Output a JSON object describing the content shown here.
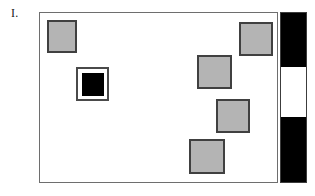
{
  "figure": {
    "panel_label": "I.",
    "frame": {
      "x": 39,
      "y": 12,
      "width": 239,
      "height": 171,
      "background_color": "#ffffff",
      "border_color": "#6e6e6e"
    },
    "marker_fill_color": "#b4b4b4",
    "marker_border_color": "#404040",
    "highlight_core_color": "#000000",
    "markers": [
      {
        "name": "marker-top-left",
        "x": 7,
        "y": 7,
        "width": 30,
        "height": 33
      },
      {
        "name": "marker-top-right",
        "x": 199,
        "y": 9,
        "width": 34,
        "height": 34
      },
      {
        "name": "marker-mid-right",
        "x": 157,
        "y": 42,
        "width": 35,
        "height": 34
      },
      {
        "name": "marker-lower-right",
        "x": 176,
        "y": 86,
        "width": 34,
        "height": 34
      },
      {
        "name": "marker-bottom",
        "x": 149,
        "y": 126,
        "width": 36,
        "height": 35
      }
    ],
    "highlight_marker": {
      "name": "marker-highlighted",
      "x": 36,
      "y": 54,
      "width": 33,
      "height": 34,
      "core_width": 22,
      "core_height": 23
    },
    "scale_bar": {
      "x": 280,
      "y": 12,
      "width": 27,
      "height": 171,
      "border_color": "#3c3c3c",
      "segments": [
        {
          "name": "scale-segment-dark-top",
          "tone": "dark",
          "height": 55
        },
        {
          "name": "scale-segment-light-middle",
          "tone": "light",
          "height": 50
        },
        {
          "name": "scale-segment-dark-bottom",
          "tone": "dark",
          "height": 66
        }
      ]
    }
  }
}
